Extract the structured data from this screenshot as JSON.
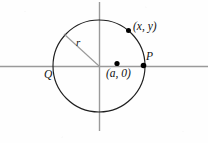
{
  "figure": {
    "type": "geometry-diagram",
    "background_color": "#fefefe",
    "axis_color": "#9a9a9a",
    "circle_color": "#1a1a1a",
    "radius_line_color": "#9a9a9a",
    "point_color": "#000000",
    "labels": {
      "point_on_circle": "(x, y)",
      "center_point": "(a, 0)",
      "right_intersection": "P",
      "left_intersection": "Q",
      "radius": "r"
    },
    "geometry": {
      "circle_center_x": 99,
      "circle_center_y": 66,
      "circle_radius": 46,
      "x_axis_y": 66,
      "x_axis_start": 0,
      "x_axis_end": 208,
      "y_axis_x": 99,
      "y_axis_start": 2,
      "y_axis_end": 131,
      "radius_line_end_x": 64,
      "radius_line_end_y": 34,
      "dot_xy_x": 128,
      "dot_xy_y": 30,
      "dot_a0_x": 117,
      "dot_a0_y": 63,
      "dot_p_x": 143,
      "dot_p_y": 66
    }
  }
}
